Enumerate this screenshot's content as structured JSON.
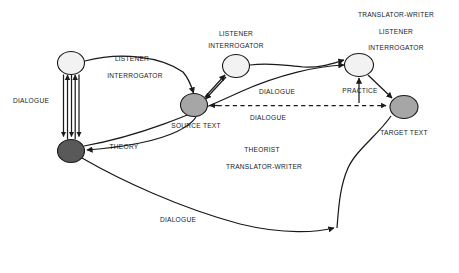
{
  "diagram": {
    "background_color": "#ffffff",
    "stroke_color": "#1a1a1a",
    "nodes": [
      {
        "id": "node-top-left",
        "label": "",
        "fill": "#f2f2f2",
        "cx": 71,
        "cy": 63,
        "rx": 13.5,
        "ry": 11.5
      },
      {
        "id": "node-bottom-left-theorist",
        "label": "",
        "fill": "#595959",
        "cx": 71,
        "cy": 151,
        "rx": 13.5,
        "ry": 11.5
      },
      {
        "id": "node-source-text",
        "label": "",
        "fill": "#a6a6a6",
        "cx": 194,
        "cy": 105,
        "rx": 13.5,
        "ry": 11.5
      },
      {
        "id": "node-middle-listener",
        "label": "",
        "fill": "#f2f2f2",
        "cx": 236,
        "cy": 66,
        "rx": 13.5,
        "ry": 11.5
      },
      {
        "id": "node-practice",
        "label": "",
        "fill": "#f2f2f2",
        "cx": 359,
        "cy": 65,
        "rx": 14.5,
        "ry": 11.5
      },
      {
        "id": "node-target-text",
        "label": "",
        "fill": "#a6a6a6",
        "cx": 404,
        "cy": 107,
        "rx": 14,
        "ry": 11.5
      }
    ],
    "labels": [
      {
        "id": "label-listener-left",
        "text": "LISTENER",
        "x": 132,
        "y": 59
      },
      {
        "id": "label-interrogator-left",
        "text": "INTERROGATOR",
        "x": 135,
        "y": 76
      },
      {
        "id": "label-dialogue-left",
        "text": "DIALOGUE",
        "x": 31,
        "y": 101
      },
      {
        "id": "label-theory",
        "text": "THEORY",
        "x": 124,
        "y": 147
      },
      {
        "id": "label-listener-middle",
        "text": "LISTENER",
        "x": 236,
        "y": 34
      },
      {
        "id": "label-interrogator-middle",
        "text": "INTERROGATOR",
        "x": 236,
        "y": 46
      },
      {
        "id": "label-source-text",
        "text": "SOURCE TEXT",
        "x": 196,
        "y": 126
      },
      {
        "id": "label-dialogue-middle",
        "text": "DIALOGUE",
        "x": 277,
        "y": 92
      },
      {
        "id": "label-dialogue-lower-middle",
        "text": "DIALOGUE",
        "x": 268,
        "y": 118
      },
      {
        "id": "label-theorist",
        "text": "THEORIST",
        "x": 262,
        "y": 150
      },
      {
        "id": "label-translator-writer-lower",
        "text": "TRANSLATOR-WRITER",
        "x": 264,
        "y": 167
      },
      {
        "id": "label-translator-writer-top",
        "text": "TRANSLATOR-WRITER",
        "x": 396,
        "y": 15
      },
      {
        "id": "label-listener-right",
        "text": "LISTENER",
        "x": 396,
        "y": 32
      },
      {
        "id": "label-interrogator-right",
        "text": "INTERROGATOR",
        "x": 396,
        "y": 48
      },
      {
        "id": "label-practice",
        "text": "PRACTICE",
        "x": 360,
        "y": 91
      },
      {
        "id": "label-target-text",
        "text": "TARGET TEXT",
        "x": 404,
        "y": 133
      },
      {
        "id": "label-dialogue-bottom",
        "text": "DIALOGUE",
        "x": 178,
        "y": 220
      }
    ]
  }
}
